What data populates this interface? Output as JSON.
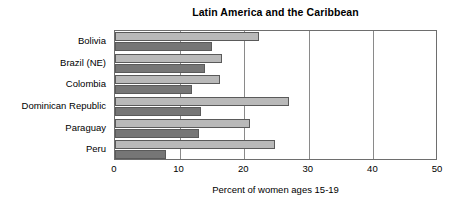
{
  "chart_data": {
    "type": "bar",
    "orientation": "horizontal",
    "title": "Latin America and the Caribbean",
    "xlabel": "Percent of women ages 15-19",
    "ylabel": "",
    "xlim": [
      0,
      50
    ],
    "xticks": [
      0,
      10,
      20,
      30,
      40,
      50
    ],
    "xtick_labels": [
      "0",
      "10",
      "20",
      "30",
      "40",
      "50"
    ],
    "grid": true,
    "legend": null,
    "categories": [
      "Bolivia",
      "Brazil (NE)",
      "Colombia",
      "Dominican Republic",
      "Paraguay",
      "Peru"
    ],
    "series": [
      {
        "name": "series-1",
        "color": "#b9b9b9",
        "values": [
          22.3,
          16.5,
          16.2,
          26.9,
          20.9,
          24.7
        ]
      },
      {
        "name": "series-2",
        "color": "#767676",
        "values": [
          15.0,
          14.0,
          11.9,
          13.3,
          13.0,
          7.9
        ]
      }
    ]
  },
  "colors": {
    "series_light": "#b9b9b9",
    "series_dark": "#767676",
    "bar_outline": "#5a5a5a",
    "axis": "#6e6e6e",
    "gridline": "#8a8a8a",
    "text": "#000000",
    "background": "#ffffff"
  }
}
